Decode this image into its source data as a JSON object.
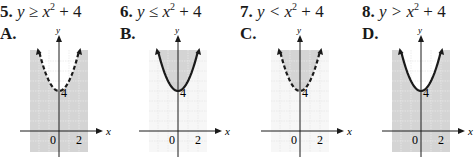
{
  "problems": [
    {
      "number": "5.",
      "inequality_lhs": "y ≥ x",
      "inequality_exp": "2",
      "inequality_rhs": " + 4",
      "choice": "A.",
      "graph": {
        "boundary": "dashed",
        "shading": "outside",
        "vertex_label": "4",
        "x_label": "x",
        "y_label": "y",
        "x_ticks": [
          "0",
          "2"
        ]
      }
    },
    {
      "number": "6.",
      "inequality_lhs": "y ≤ x",
      "inequality_exp": "2",
      "inequality_rhs": " + 4",
      "choice": "B.",
      "graph": {
        "boundary": "solid",
        "shading": "inside",
        "vertex_label": "4",
        "x_label": "x",
        "y_label": "y",
        "x_ticks": [
          "0",
          "2"
        ]
      }
    },
    {
      "number": "7.",
      "inequality_lhs": "y < x",
      "inequality_exp": "2",
      "inequality_rhs": " + 4",
      "choice": "C.",
      "graph": {
        "boundary": "dashed",
        "shading": "inside",
        "vertex_label": "4",
        "x_label": "x",
        "y_label": "y",
        "x_ticks": [
          "0",
          "2"
        ]
      }
    },
    {
      "number": "8.",
      "inequality_lhs": "y > x",
      "inequality_exp": "2",
      "inequality_rhs": " + 4",
      "choice": "D.",
      "graph": {
        "boundary": "solid",
        "shading": "outside",
        "vertex_label": "4",
        "x_label": "x",
        "y_label": "y",
        "x_ticks": [
          "0",
          "2"
        ]
      }
    }
  ],
  "colors": {
    "shade": "#d4d4d4",
    "grid": "#ffffff",
    "curve": "#1a1a1a",
    "axis": "#1a1a1a"
  }
}
